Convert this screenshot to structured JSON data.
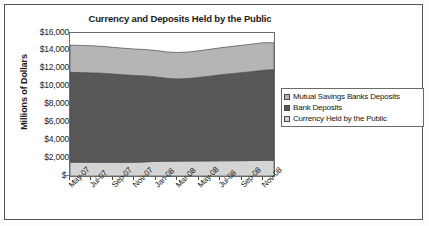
{
  "chart_data": {
    "type": "area",
    "stacked": true,
    "title": "Currency and Deposits Held by the Public",
    "xlabel": "",
    "ylabel": "Millions of Dollars",
    "ylim": [
      0,
      16000
    ],
    "ytick_labels": [
      "$16,000",
      "$14,000",
      "$12,000",
      "$10,000",
      "$8,000",
      "$6,000",
      "$4,000",
      "$2,000",
      "$-"
    ],
    "ytick_values": [
      16000,
      14000,
      12000,
      10000,
      8000,
      6000,
      4000,
      2000,
      0
    ],
    "grid": false,
    "legend_position": "right",
    "categories": [
      "May-07",
      "Jun-07",
      "Jul-07",
      "Aug-07",
      "Sep-07",
      "Oct-07",
      "Nov-07",
      "Dec-07",
      "Jan-08",
      "Feb-08",
      "Mar-08",
      "Apr-08",
      "May-08",
      "Jun-08",
      "Jul-08",
      "Aug-08",
      "Sep-08",
      "Oct-08",
      "Nov-08",
      "Dec-08"
    ],
    "xtick_labels": [
      "May-07",
      "Jul-07",
      "Sep-07",
      "Nov-07",
      "Jan-08",
      "Mar-08",
      "May-08",
      "Jul-08",
      "Sep-08",
      "Nov-08"
    ],
    "series": [
      {
        "name": "Currency Held by the Public",
        "color": "#d4d4d4",
        "values": [
          1550,
          1545,
          1540,
          1535,
          1530,
          1535,
          1545,
          1580,
          1640,
          1660,
          1665,
          1670,
          1680,
          1690,
          1700,
          1705,
          1715,
          1730,
          1745,
          1760
        ]
      },
      {
        "name": "Bank Deposits",
        "color": "#585858",
        "values": [
          10050,
          10030,
          10000,
          9960,
          9880,
          9790,
          9700,
          9620,
          9450,
          9280,
          9200,
          9240,
          9350,
          9480,
          9620,
          9740,
          9850,
          9960,
          10080,
          10150
        ]
      },
      {
        "name": "Mutual Savings Banks Deposits",
        "color": "#b5b5b5",
        "values": [
          3050,
          3040,
          3030,
          3010,
          2990,
          2970,
          2960,
          2950,
          2950,
          2940,
          2950,
          2960,
          2980,
          3000,
          3020,
          3040,
          3060,
          3080,
          3090,
          3000
        ]
      }
    ],
    "legend_entries": [
      {
        "label": "Mutual Savings Banks Deposits",
        "color": "#b5b5b5"
      },
      {
        "label": "Bank Deposits",
        "color": "#585858"
      },
      {
        "label": "Currency Held by the Public",
        "color": "#d4d4d4"
      }
    ]
  }
}
